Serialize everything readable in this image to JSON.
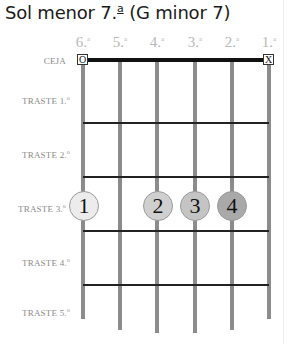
{
  "title": {
    "main": "Sol menor 7.",
    "sup": "a",
    "rest": " (G minor 7)"
  },
  "strings": [
    {
      "num": "6.",
      "sup": "a",
      "x": 83,
      "bottom": 319
    },
    {
      "num": "5.",
      "sup": "a",
      "x": 120,
      "bottom": 330
    },
    {
      "num": "4.",
      "sup": "a",
      "x": 157,
      "bottom": 333
    },
    {
      "num": "3.",
      "sup": "a",
      "x": 195,
      "bottom": 333
    },
    {
      "num": "2.",
      "sup": "a",
      "x": 232,
      "bottom": 330
    },
    {
      "num": "1.",
      "sup": "a",
      "x": 269,
      "bottom": 319
    }
  ],
  "nut_label": "CEJA",
  "open_markers": [
    {
      "string": 6,
      "symbol": "O"
    },
    {
      "string": 1,
      "symbol": "X"
    }
  ],
  "frets": [
    {
      "label": "TRASTE 1.",
      "sup": "o"
    },
    {
      "label": "TRASTE 2.",
      "sup": "o"
    },
    {
      "label": "TRASTE 3.",
      "sup": "o"
    },
    {
      "label": "TRASTE 4.",
      "sup": "o"
    },
    {
      "label": "TRASTE 5.",
      "sup": "o"
    }
  ],
  "fingers": [
    {
      "finger": "1",
      "string": 6,
      "fret": 3,
      "color": "#ececec"
    },
    {
      "finger": "2",
      "string": 4,
      "fret": 3,
      "color": "#cfcfcf"
    },
    {
      "finger": "3",
      "string": 3,
      "fret": 3,
      "color": "#c4c4c4"
    },
    {
      "finger": "4",
      "string": 2,
      "fret": 3,
      "color": "#a9a9a9"
    }
  ]
}
